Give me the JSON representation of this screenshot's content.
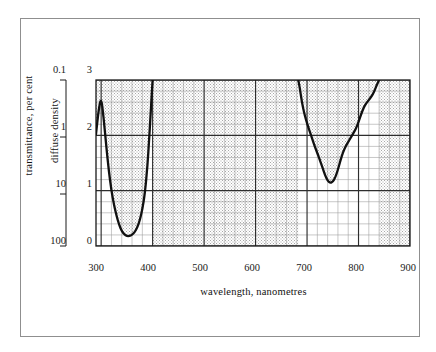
{
  "figure": {
    "background": "#ffffff",
    "frame_color": "#8f8f8f"
  },
  "chart_data": {
    "type": "line",
    "title": "",
    "xlabel": "wavelength, nanometres",
    "ylabel": "diffuse density",
    "ylabel_secondary": "transmittance, per cent",
    "xlim": [
      290,
      900
    ],
    "ylim": [
      0,
      3
    ],
    "y_inverted": false,
    "grid": true,
    "grid_major_color": "#3a3a3a",
    "grid_minor_color": "#9a9a9a",
    "curve_color": "#111111",
    "shade_color": "#cfcfcf",
    "legend": "none",
    "xticks": [
      300,
      400,
      500,
      600,
      700,
      800,
      900
    ],
    "xtick_labels": [
      "300",
      "400",
      "500",
      "600",
      "700",
      "800",
      "900"
    ],
    "x_minor_step": 20,
    "yticks": [
      0,
      1,
      2,
      3
    ],
    "ytick_labels": [
      "0",
      "1",
      "2",
      "3"
    ],
    "y_minor_step": 0.2,
    "transmittance_ticks": [
      100,
      10,
      1,
      0.1
    ],
    "transmittance_tick_labels": [
      "100",
      "10",
      "1",
      "0.1"
    ],
    "transmittance_at_density": {
      "0": "100",
      "1": "10",
      "2": "1",
      "3": "0.1"
    },
    "series": [
      {
        "name": "diffuse density",
        "x": [
          290,
          295,
          300,
          305,
          310,
          315,
          320,
          325,
          330,
          335,
          340,
          345,
          350,
          355,
          360,
          365,
          370,
          375,
          380,
          385,
          390,
          393,
          396,
          398,
          400,
          683,
          686,
          690,
          694,
          698,
          702,
          706,
          710,
          715,
          720,
          725,
          730,
          735,
          740,
          745,
          750,
          755,
          760,
          765,
          770,
          775,
          780,
          785,
          790,
          795,
          800,
          805,
          810,
          815,
          820,
          825,
          830,
          835,
          840
        ],
        "y": [
          2.02,
          2.45,
          2.7,
          2.3,
          1.8,
          1.35,
          1.0,
          0.74,
          0.54,
          0.38,
          0.27,
          0.21,
          0.18,
          0.18,
          0.2,
          0.25,
          0.33,
          0.46,
          0.66,
          0.95,
          1.45,
          1.9,
          2.35,
          2.7,
          3.0,
          3.0,
          2.85,
          2.6,
          2.42,
          2.28,
          2.16,
          2.05,
          1.94,
          1.8,
          1.68,
          1.55,
          1.42,
          1.28,
          1.18,
          1.14,
          1.16,
          1.24,
          1.38,
          1.55,
          1.7,
          1.8,
          1.88,
          1.96,
          2.04,
          2.12,
          2.24,
          2.38,
          2.5,
          2.58,
          2.64,
          2.7,
          2.78,
          2.9,
          3.0
        ]
      }
    ],
    "features": [
      {
        "name": "uv-transmission-minimum",
        "wavelength": 350,
        "density": 0.18,
        "transmittance_percent": 66
      },
      {
        "name": "ir-transmission-minimum",
        "wavelength": 745,
        "density": 1.14,
        "transmittance_percent": 7.2
      },
      {
        "name": "uv-band-upper-cutoff",
        "wavelength": 400
      },
      {
        "name": "ir-band-lower-cutoff",
        "wavelength": 685
      },
      {
        "name": "ir-band-upper-cutoff",
        "wavelength": 840
      }
    ]
  },
  "axes": {
    "transmittance_axis_title": "transmittance, per cent",
    "density_axis_title": "diffuse density",
    "x_axis_title": "wavelength, nanometres"
  }
}
